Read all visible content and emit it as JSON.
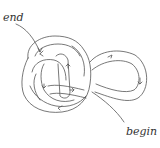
{
  "diagram": {
    "title": "",
    "labels": {
      "end": "end",
      "begin": "begin"
    },
    "colors": {
      "stroke": "#555555",
      "background": "#ffffff"
    }
  }
}
